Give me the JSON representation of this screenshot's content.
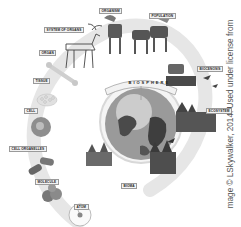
{
  "diagram": {
    "center": {
      "label": "BIOSPHERE",
      "icon": "globe"
    },
    "levels": [
      {
        "label": "ATOM",
        "icon": "atom"
      },
      {
        "label": "MOLECULE",
        "icon": "molecule"
      },
      {
        "label": "CELL ORGANELLES",
        "icon": "organelles"
      },
      {
        "label": "CELL",
        "icon": "cell"
      },
      {
        "label": "TISSUE",
        "icon": "tissue"
      },
      {
        "label": "ORGAN",
        "icon": "bone"
      },
      {
        "label": "SYSTEM OF ORGANS",
        "icon": "moose-skeleton"
      },
      {
        "label": "ORGANISM",
        "icon": "moose"
      },
      {
        "label": "POPULATION",
        "icon": "moose-herd"
      },
      {
        "label": "BIOCENOSIS",
        "icon": "moose-and-birds"
      },
      {
        "label": "ECOSYSTEM",
        "icon": "landscape"
      },
      {
        "label": "BIOMA",
        "icon": "forest"
      }
    ],
    "colors": {
      "arc": "#e6e6e6",
      "label_bg": "#f2f2f2",
      "label_border": "#9a9a9a",
      "ink": "#333333"
    }
  },
  "credit": "mage © LSkywalker, 2014. Used under license from"
}
